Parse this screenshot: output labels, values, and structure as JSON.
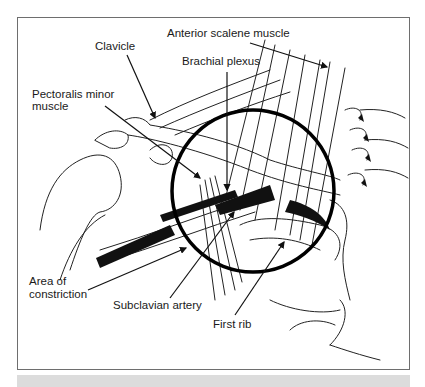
{
  "figure": {
    "labels": {
      "anterior_scalene": "Anterior scalene muscle",
      "clavicle": "Clavicle",
      "brachial_plexus": "Brachial plexus",
      "pectoralis_line1": "Pectoralis minor",
      "pectoralis_line2": "muscle",
      "area_line1": "Area of",
      "area_line2": "constriction",
      "subclavian_artery": "Subclavian artery",
      "first_rib": "First rib"
    },
    "colors": {
      "frame": "#6e6e6e",
      "ink": "#111111",
      "caption_band": "#dcdcdc"
    }
  }
}
